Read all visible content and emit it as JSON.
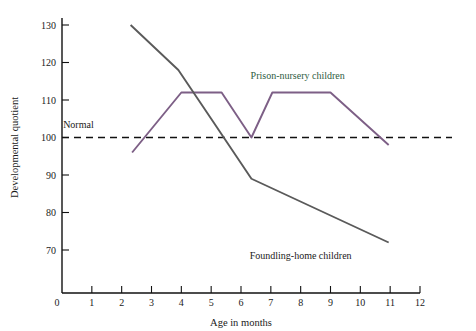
{
  "chart_data": {
    "type": "line",
    "title": "",
    "xlabel": "Age in months",
    "ylabel": "Developmental quotient",
    "xlim": [
      0,
      12
    ],
    "ylim": [
      65,
      133
    ],
    "grid": false,
    "legend_position": "inline-annotations",
    "x_ticks": [
      "0",
      "1",
      "2",
      "3",
      "4",
      "5",
      "6",
      "7",
      "8",
      "9",
      "10",
      "11",
      "12"
    ],
    "y_ticks": [
      "70",
      "80",
      "90",
      "100",
      "110",
      "120",
      "130"
    ],
    "y_origin_tick": "0",
    "annotations": [
      {
        "text": "Normal",
        "x": 0.55,
        "y": 102.5,
        "color": "#1a1a1a"
      },
      {
        "text": "Prison-nursery children",
        "x": 7.9,
        "y": 115.5,
        "color": "#2f5d3f"
      },
      {
        "text": "Foundling-home children",
        "x": 8.0,
        "y": 67.6,
        "color": "#1a1a1a"
      }
    ],
    "reference_lines": [
      {
        "name": "Normal",
        "value": 100,
        "style": "dashed",
        "color": "#111111"
      }
    ],
    "series": [
      {
        "name": "Prison-nursery children",
        "color": "#7d5f86",
        "x": [
          2.35,
          4.0,
          5.35,
          6.35,
          7.05,
          9.0,
          10.95
        ],
        "values": [
          96,
          112,
          112,
          100,
          112,
          112,
          98
        ]
      },
      {
        "name": "Foundling-home children",
        "color": "#5a5a5a",
        "x": [
          2.3,
          3.9,
          5.0,
          6.35,
          10.95
        ],
        "values": [
          130,
          118,
          105,
          89,
          72
        ]
      }
    ]
  }
}
